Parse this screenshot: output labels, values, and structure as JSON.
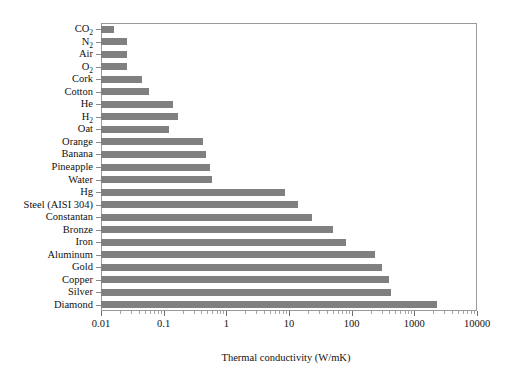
{
  "chart_data": {
    "type": "bar",
    "orientation": "horizontal",
    "title": "",
    "xlabel": "Thermal conductivity (W/mK)",
    "ylabel": "",
    "xscale": "log",
    "xlim": [
      0.01,
      10000
    ],
    "grid": false,
    "legend": null,
    "bar_color": "#808080",
    "frame_color": "#9a9a9a",
    "xticks": [
      0.01,
      0.1,
      1,
      10,
      100,
      1000,
      10000
    ],
    "xticklabels": [
      "0.01",
      "0.1",
      "1",
      "10",
      "100",
      "1000",
      "10000"
    ],
    "categories": [
      "CO2",
      "N2",
      "Air",
      "O2",
      "Cork",
      "Cotton",
      "He",
      "H2",
      "Oat",
      "Orange",
      "Banana",
      "Pineapple",
      "Water",
      "Hg",
      "Steel (AISI 304)",
      "Constantan",
      "Bronze",
      "Iron",
      "Aluminum",
      "Gold",
      "Copper",
      "Silver",
      "Diamond"
    ],
    "category_labels_html": [
      "CO<sub>2</sub>",
      "N<sub>2</sub>",
      "Air",
      "O<sub>2</sub>",
      "Cork",
      "Cotton",
      "He",
      "H<sub>2</sub>",
      "Oat",
      "Orange",
      "Banana",
      "Pineapple",
      "Water",
      "Hg",
      "Steel (AISI 304)",
      "Constantan",
      "Bronze",
      "Iron",
      "Aluminum",
      "Gold",
      "Copper",
      "Silver",
      "Diamond"
    ],
    "values": [
      0.016,
      0.026,
      0.026,
      0.026,
      0.045,
      0.058,
      0.142,
      0.168,
      0.12,
      0.42,
      0.48,
      0.55,
      0.6,
      8.5,
      14,
      23,
      50,
      80,
      235,
      310,
      400,
      430,
      2300
    ],
    "units": "W/mK"
  }
}
